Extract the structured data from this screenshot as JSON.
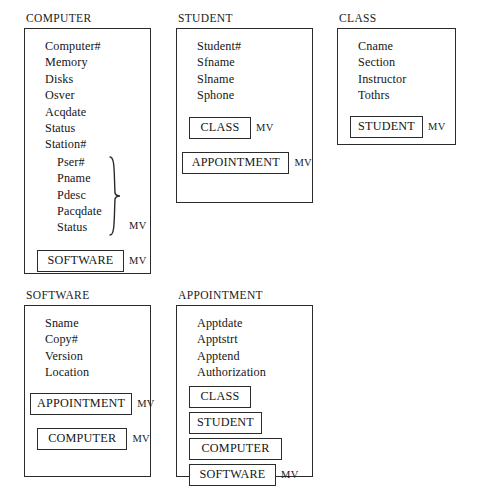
{
  "diagram": {
    "kind": "entity-file-structure-diagram",
    "multivalue_marker": "MV",
    "entities": [
      {
        "id": "computer",
        "title": "COMPUTER",
        "attributes": [
          "Computer#",
          "Memory",
          "Disks",
          "Osver",
          "Acqdate",
          "Status",
          "Station#"
        ],
        "repeating_group": {
          "attributes": [
            "Pser#",
            "Pname",
            "Pdesc",
            "Pacqdate",
            "Status"
          ],
          "marker": "MV"
        },
        "references": [
          {
            "label": "SOFTWARE",
            "marker": "MV"
          }
        ]
      },
      {
        "id": "student",
        "title": "STUDENT",
        "attributes": [
          "Student#",
          "Sfname",
          "Slname",
          "Sphone"
        ],
        "references": [
          {
            "label": "CLASS",
            "marker": "MV"
          },
          {
            "label": "APPOINTMENT",
            "marker": "MV"
          }
        ]
      },
      {
        "id": "class",
        "title": "CLASS",
        "attributes": [
          "Cname",
          "Section",
          "Instructor",
          "Tothrs"
        ],
        "references": [
          {
            "label": "STUDENT",
            "marker": "MV"
          }
        ]
      },
      {
        "id": "software",
        "title": "SOFTWARE",
        "attributes": [
          "Sname",
          "Copy#",
          "Version",
          "Location"
        ],
        "references": [
          {
            "label": "APPOINTMENT",
            "marker": "MV"
          },
          {
            "label": "COMPUTER",
            "marker": "MV"
          }
        ]
      },
      {
        "id": "appointment",
        "title": "APPOINTMENT",
        "attributes": [
          "Apptdate",
          "Apptstrt",
          "Apptend",
          "Authorization"
        ],
        "references": [
          {
            "label": "CLASS",
            "marker": ""
          },
          {
            "label": "STUDENT",
            "marker": ""
          },
          {
            "label": "COMPUTER",
            "marker": ""
          },
          {
            "label": "SOFTWARE",
            "marker": "MV"
          }
        ]
      }
    ]
  },
  "colors": {
    "background": "#ffffff",
    "ink": "#151515",
    "border": "#2b2b2b"
  }
}
